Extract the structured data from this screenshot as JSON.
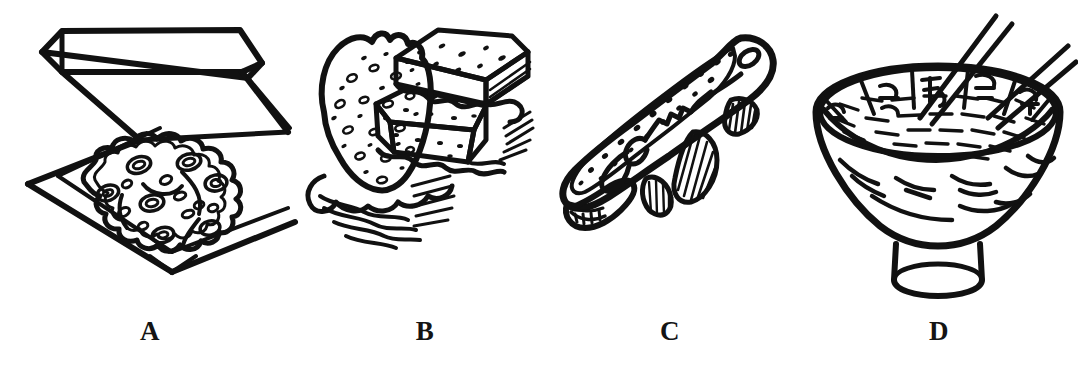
{
  "figure": {
    "type": "line-art-illustration",
    "background_color": "#ffffff",
    "ink_color": "#111111",
    "panel_count": 4
  },
  "panels": [
    {
      "id": "a",
      "label": "A",
      "subject": "pizza-in-open-box",
      "subject_name": "Pizza in an open delivery box",
      "icon_name": "pizza-box-icon",
      "details": [
        "open square cardboard box with raised lid",
        "round pizza with wavy crust edge",
        "scattered round pepperoni / topping slices",
        "curved sausage or pepper strips"
      ]
    },
    {
      "id": "b",
      "label": "B",
      "subject": "stacked-sandwiches",
      "subject_name": "Stacked sandwiches with bread and lettuce",
      "icon_name": "sandwich-icon",
      "details": [
        "tall oval seeded bread slice in front",
        "two rectangular layered sandwich halves behind",
        "ruffled lettuce leaves between bread layers",
        "speckled bread crumb texture"
      ]
    },
    {
      "id": "c",
      "label": "C",
      "subject": "whole-fish",
      "subject_name": "Whole fish",
      "icon_name": "fish-icon",
      "details": [
        "fish seen from the side, head at upper right",
        "round eye",
        "speckled dorsal back",
        "hatched dorsal, pectoral and pelvic fins",
        "forked tail at lower left with gill hatching"
      ]
    },
    {
      "id": "d",
      "label": "D",
      "subject": "rice-bowl-with-chopsticks",
      "subject_name": "Bowl of rice or noodles with chopsticks",
      "icon_name": "rice-bowl-icon",
      "details": [
        "footed ceramic bowl",
        "patterned decorative rim and body",
        "mound of rice / noodles shown with short strokes",
        "two pairs of chopsticks entering from the upper right"
      ]
    }
  ],
  "labels": {
    "a": "A",
    "b": "B",
    "c": "C",
    "d": "D"
  }
}
